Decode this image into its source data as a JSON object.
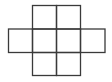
{
  "diagram": {
    "type": "grid-net",
    "stroke_color": "#3a3a3a",
    "background": "#ffffff",
    "cells": [
      {
        "row": 0,
        "col": 1
      },
      {
        "row": 0,
        "col": 2
      },
      {
        "row": 1,
        "col": 0
      },
      {
        "row": 1,
        "col": 1
      },
      {
        "row": 1,
        "col": 2
      },
      {
        "row": 1,
        "col": 3
      },
      {
        "row": 2,
        "col": 1
      },
      {
        "row": 2,
        "col": 2
      }
    ]
  }
}
